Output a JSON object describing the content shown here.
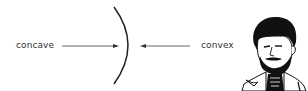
{
  "diagram": {
    "labels": {
      "concave": "concave",
      "convex": "convex"
    },
    "arrows": [
      {
        "from": "concave-label",
        "to": "lens-curve",
        "direction": "right"
      },
      {
        "from": "convex-label",
        "to": "lens-curve",
        "direction": "left"
      }
    ],
    "curve": {
      "shape": "right-bulging arc"
    },
    "illustration": "bearded-man-portrait",
    "colors": {
      "text": "#333333",
      "line": "#444444",
      "curve": "#222222",
      "ink": "#111111"
    }
  }
}
